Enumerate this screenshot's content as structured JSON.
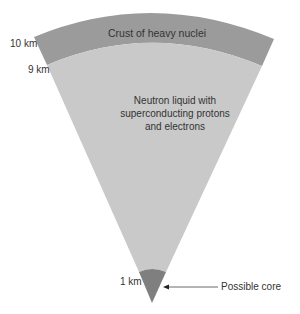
{
  "diagram": {
    "crust_label": "Crust of heavy nuclei",
    "liquid_label_lines": [
      "Neutron liquid with",
      "superconducting protons",
      "and electrons"
    ],
    "core_label": "Possible core",
    "radius_labels": {
      "outer": "10 km",
      "inner": "9 km",
      "core": "1 km"
    },
    "colors": {
      "crust": "#9b9b9b",
      "liquid": "#c9c9c9",
      "core": "#7f7f7f",
      "text": "#333333"
    }
  }
}
